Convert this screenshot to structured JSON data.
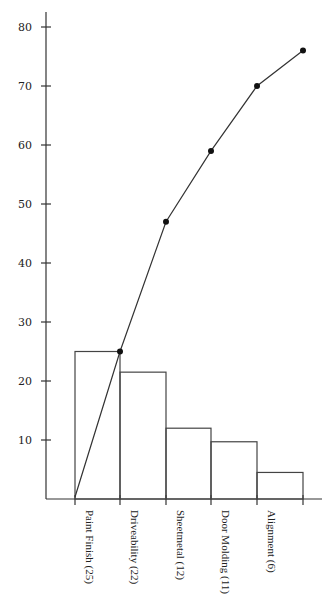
{
  "chart_data": {
    "type": "bar",
    "subtype": "pareto",
    "title": "",
    "xlabel": "",
    "ylabel": "",
    "ylim": [
      0,
      80
    ],
    "yticks": [
      10,
      20,
      30,
      40,
      50,
      60,
      70,
      80
    ],
    "grid": false,
    "legend": null,
    "categories": [
      "Paint Finish (25)",
      "Driveability (22)",
      "Sheetmetal (12)",
      "Door Molding (11)",
      "Alignment (6)"
    ],
    "series": [
      {
        "name": "Defect count",
        "type": "bar",
        "values": [
          25,
          22,
          12,
          11,
          6
        ],
        "drawn_heights": [
          25,
          21.5,
          12,
          9.7,
          4.5
        ]
      },
      {
        "name": "Cumulative",
        "type": "line",
        "start": 0,
        "values": [
          25,
          47,
          59,
          70,
          76
        ]
      }
    ]
  },
  "colors": {
    "line": "#333333",
    "bar_stroke": "#444444",
    "background": "#ffffff"
  }
}
